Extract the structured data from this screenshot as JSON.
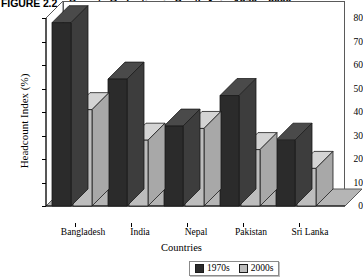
{
  "figure": {
    "number": "FIGURE 2.2",
    "title": "Poverty Reduction in South Asia, 1970s–2000s"
  },
  "legend": {
    "position": "bottom-center",
    "items": [
      {
        "label": "1970s",
        "color": "#2b2b2b"
      },
      {
        "label": "2000s",
        "color": "#bdbdbd"
      }
    ]
  },
  "axis": {
    "ylabel": "Headcount Index (%)",
    "xlabel": "Countries",
    "yticks": [
      "80",
      "70",
      "60",
      "50",
      "40",
      "30",
      "20",
      "10",
      "0"
    ]
  },
  "colors": {
    "series_1970s": "#2b2b2b",
    "series_1970s_side": "#3d3d3d",
    "series_1970s_top": "#4a4a4a",
    "series_2000s": "#bdbdbd",
    "series_2000s_side": "#a8a8a8",
    "series_2000s_top": "#d4d4d4",
    "floor": "#b5b5b5",
    "wall": "#ffffff",
    "outline": "#5a5a5a"
  },
  "chart_data": {
    "type": "bar",
    "title": "Poverty Reduction in South Asia, 1970s–2000s",
    "xlabel": "Countries",
    "ylabel": "Headcount Index (%)",
    "ylim": [
      0,
      80
    ],
    "ytick_step": 10,
    "grid": false,
    "legend_position": "bottom-center",
    "categories": [
      "Bangladesh",
      "India",
      "Nepal",
      "Pakistan",
      "Sri Lanka"
    ],
    "series": [
      {
        "name": "1970s",
        "values": [
          78,
          54,
          34,
          47,
          28
        ]
      },
      {
        "name": "2000s",
        "values": [
          41,
          28,
          33,
          24,
          16
        ]
      }
    ]
  }
}
